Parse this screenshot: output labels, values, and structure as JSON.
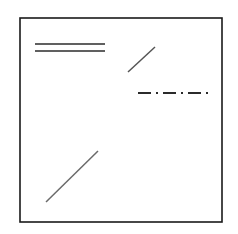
{
  "figure": {
    "title": "",
    "background_color": "#ffffff",
    "canvas": {
      "width": 238,
      "height": 234
    },
    "frame": {
      "name": "plot-border",
      "x": 20,
      "y": 18,
      "width": 202,
      "height": 204,
      "stroke_color": "#1a1a1a",
      "stroke_width": 1.6,
      "fill": "none"
    },
    "elements": [
      {
        "name": "double-line-upper",
        "kind": "line",
        "style": "solid",
        "x1": 35,
        "y1": 44,
        "x2": 105,
        "y2": 44,
        "stroke_color": "#2b2b2b",
        "stroke_width": 1.5,
        "dasharray": ""
      },
      {
        "name": "double-line-lower",
        "kind": "line",
        "style": "solid",
        "x1": 35,
        "y1": 51,
        "x2": 105,
        "y2": 51,
        "stroke_color": "#2b2b2b",
        "stroke_width": 1.5,
        "dasharray": ""
      },
      {
        "name": "short-diagonal-upper-right",
        "kind": "line",
        "style": "solid",
        "x1": 128,
        "y1": 72,
        "x2": 155,
        "y2": 47,
        "stroke_color": "#555555",
        "stroke_width": 1.5,
        "dasharray": ""
      },
      {
        "name": "dash-dot-horizontal-line",
        "kind": "line",
        "style": "dash-dot",
        "x1": 138,
        "y1": 93,
        "x2": 211,
        "y2": 93,
        "stroke_color": "#2b2b2b",
        "stroke_width": 1.8,
        "dasharray": "13 5 2 5"
      },
      {
        "name": "long-diagonal-lower-left",
        "kind": "line",
        "style": "solid",
        "x1": 46,
        "y1": 202,
        "x2": 98,
        "y2": 151,
        "stroke_color": "#6a6a6a",
        "stroke_width": 1.5,
        "dasharray": ""
      }
    ]
  }
}
